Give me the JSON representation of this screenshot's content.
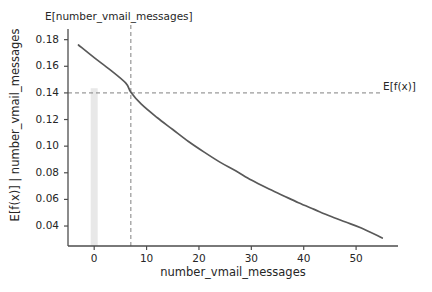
{
  "chart_data": {
    "type": "line",
    "title": "",
    "xlabel": "number_vmail_messages",
    "ylabel": "E[f(x)] | number_vmail_messages",
    "xlim": [
      -5,
      58
    ],
    "ylim": [
      0.025,
      0.185
    ],
    "xticks": [
      0,
      10,
      20,
      30,
      40,
      50
    ],
    "xtick_labels": [
      "0",
      "10",
      "20",
      "30",
      "40",
      "50"
    ],
    "yticks": [
      0.04,
      0.06,
      0.08,
      0.1,
      0.12,
      0.14,
      0.16,
      0.18
    ],
    "ytick_labels": [
      "0.04",
      "0.06",
      "0.08",
      "0.10",
      "0.12",
      "0.14",
      "0.16",
      "0.18"
    ],
    "grid": false,
    "legend": "none",
    "line_color": "#595959",
    "series": [
      {
        "name": "partial_dependence",
        "x": [
          -3,
          0,
          3,
          6,
          7,
          9,
          12,
          15,
          18,
          21,
          24,
          27,
          30,
          33,
          36,
          39,
          42,
          45,
          48,
          51,
          55
        ],
        "y": [
          0.176,
          0.1665,
          0.1575,
          0.1475,
          0.1405,
          0.1315,
          0.1215,
          0.1125,
          0.1035,
          0.0955,
          0.088,
          0.0815,
          0.0745,
          0.0685,
          0.063,
          0.0575,
          0.0525,
          0.0475,
          0.043,
          0.0385,
          0.031
        ]
      }
    ],
    "annotations": [
      {
        "name": "expected-x-annotation",
        "label": "E[number_vmail_messages]",
        "type": "vline",
        "x": 7,
        "style": "dashed",
        "color": "#808080"
      },
      {
        "name": "expected-fx-annotation",
        "label": "E[f(x)]",
        "type": "hline",
        "y": 0.14,
        "style": "dashed",
        "color": "#808080"
      }
    ],
    "histogram_bar": {
      "name": "rug-bar",
      "x": 0,
      "height_top": 0.1435,
      "color": "#e8e8e8"
    }
  },
  "axes": {
    "spine_color": "#4d4d4d",
    "tick_color": "#4d4d4d",
    "background": "#ffffff"
  }
}
